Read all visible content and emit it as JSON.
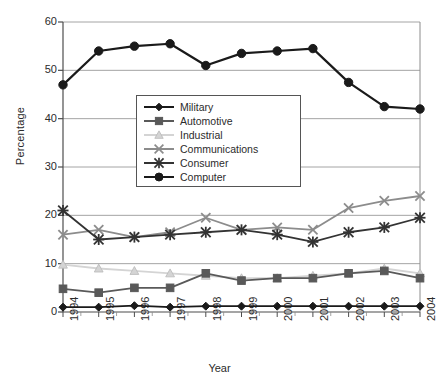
{
  "chart_data": {
    "type": "line",
    "title": "",
    "xlabel": "Year",
    "ylabel": "Percentage",
    "categories": [
      "1994",
      "1995",
      "1996",
      "1997",
      "1998",
      "1999",
      "2000",
      "2001",
      "2002",
      "2003",
      "2004"
    ],
    "x": [
      1994,
      1995,
      1996,
      1997,
      1998,
      1999,
      2000,
      2001,
      2002,
      2003,
      2004
    ],
    "ylim": [
      0,
      60
    ],
    "yticks": [
      0,
      10,
      20,
      30,
      40,
      50,
      60
    ],
    "grid": "horizontal",
    "legend_position": "inside-upper-center",
    "series": [
      {
        "name": "Military",
        "marker": "diamond",
        "color": "#1a1a1a",
        "values": [
          1.0,
          1.0,
          1.3,
          1.0,
          1.2,
          1.2,
          1.2,
          1.2,
          1.2,
          1.2,
          1.2
        ]
      },
      {
        "name": "Automotive",
        "marker": "square",
        "color": "#595959",
        "values": [
          4.8,
          4.0,
          5.0,
          5.0,
          8.0,
          6.5,
          7.0,
          7.0,
          8.0,
          8.5,
          7.0
        ]
      },
      {
        "name": "Industrial",
        "marker": "triangle",
        "color": "#d4d4d4",
        "values": [
          9.8,
          9.0,
          8.5,
          8.0,
          7.5,
          7.0,
          7.0,
          7.5,
          8.0,
          9.0,
          8.0
        ]
      },
      {
        "name": "Communications",
        "marker": "x",
        "color": "#8c8c8c",
        "values": [
          16.0,
          17.0,
          15.5,
          16.5,
          19.5,
          17.0,
          17.5,
          17.0,
          21.5,
          23.0,
          24.0
        ]
      },
      {
        "name": "Consumer",
        "marker": "star",
        "color": "#333333",
        "values": [
          21.0,
          15.0,
          15.5,
          16.0,
          16.5,
          17.0,
          16.0,
          14.5,
          16.5,
          17.5,
          19.5
        ]
      },
      {
        "name": "Computer",
        "marker": "circle",
        "color": "#1a1a1a",
        "values": [
          47.0,
          54.0,
          55.0,
          55.5,
          51.0,
          53.5,
          54.0,
          54.5,
          47.5,
          42.5,
          42.0
        ]
      }
    ]
  },
  "axes": {
    "y_title": "Percentage",
    "x_title": "Year"
  }
}
